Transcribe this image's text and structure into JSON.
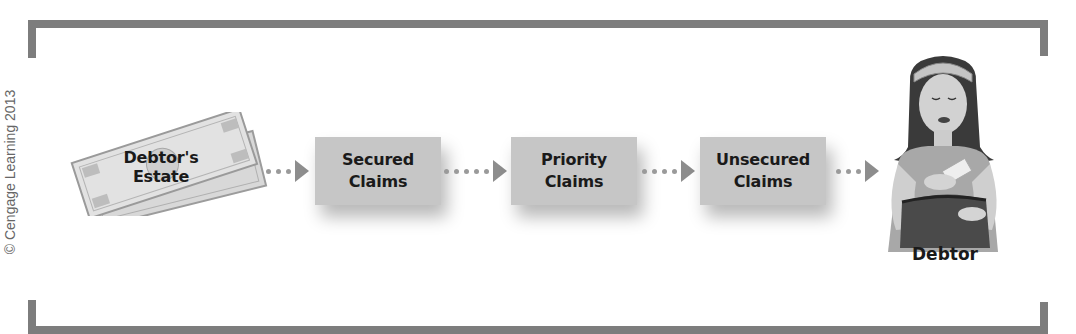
{
  "copyright": "© Cengage Learning 2013",
  "colors": {
    "frame": "#7d7d7d",
    "box_fill": "#c6c6c6",
    "arrow": "#8d8d8d",
    "dots": "#9a9a9a",
    "text": "#1a1a1a"
  },
  "flow": {
    "source": {
      "label_line1": "Debtor's",
      "label_line2": "Estate",
      "icon": "money-bills-icon"
    },
    "steps": [
      {
        "line1": "Secured",
        "line2": "Claims"
      },
      {
        "line1": "Priority",
        "line2": "Claims"
      },
      {
        "line1": "Unsecured",
        "line2": "Claims"
      }
    ],
    "destination": {
      "label": "Debtor",
      "icon": "woman-with-purse-icon"
    }
  }
}
